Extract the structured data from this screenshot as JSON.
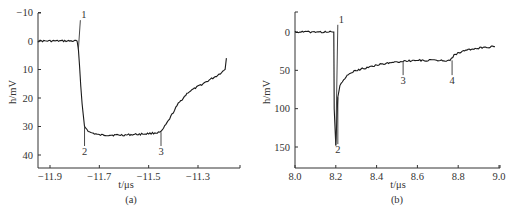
{
  "chart_data": [
    {
      "panel": "a",
      "type": "line",
      "caption": "(a)",
      "xlabel": "t/μs",
      "ylabel": "h/mV",
      "y_inverted": true,
      "xlim": [
        -11.95,
        -11.18
      ],
      "ylim": [
        -10,
        45
      ],
      "xticks": [
        -11.9,
        -11.7,
        -11.5,
        -11.3
      ],
      "yticks": [
        -10,
        0,
        10,
        20,
        30,
        40
      ],
      "xtick_labels": [
        "−11.9",
        "−11.7",
        "−11.5",
        "−11.3"
      ],
      "ytick_labels": [
        "−10",
        "0",
        "10",
        "20",
        "30",
        "40"
      ],
      "grid": false,
      "series": [
        {
          "name": "signal",
          "x": [
            -11.95,
            -11.9,
            -11.85,
            -11.79,
            -11.785,
            -11.77,
            -11.76,
            -11.74,
            -11.7,
            -11.6,
            -11.5,
            -11.45,
            -11.42,
            -11.38,
            -11.34,
            -11.3,
            -11.26,
            -11.22,
            -11.19,
            -11.185
          ],
          "y": [
            0,
            0,
            0,
            0,
            3,
            22,
            30,
            32,
            33,
            33,
            32.5,
            32,
            28,
            22,
            18,
            16,
            14,
            12,
            10,
            6
          ]
        }
      ],
      "annotations": [
        {
          "label": "1",
          "x": -11.785,
          "y": -8
        },
        {
          "label": "2",
          "x": -11.76,
          "y": 40
        },
        {
          "label": "3",
          "x": -11.45,
          "y": 40
        }
      ]
    },
    {
      "panel": "b",
      "type": "line",
      "caption": "(b)",
      "xlabel": "t/μs",
      "ylabel": "h/mV",
      "y_inverted": true,
      "xlim": [
        8.0,
        9.0
      ],
      "ylim": [
        -20,
        175
      ],
      "xticks": [
        8.0,
        8.2,
        8.4,
        8.6,
        8.8,
        9.0
      ],
      "yticks": [
        0,
        50,
        100,
        150
      ],
      "xtick_labels": [
        "8.0",
        "8.2",
        "8.4",
        "8.6",
        "8.8",
        "9.0"
      ],
      "ytick_labels": [
        "0",
        "50",
        "100",
        "150"
      ],
      "grid": false,
      "series": [
        {
          "name": "signal",
          "x": [
            8.0,
            8.1,
            8.19,
            8.192,
            8.2,
            8.205,
            8.21,
            8.22,
            8.25,
            8.3,
            8.4,
            8.5,
            8.53,
            8.6,
            8.7,
            8.76,
            8.78,
            8.82,
            8.9,
            8.98
          ],
          "y": [
            0,
            0,
            0,
            100,
            148,
            115,
            85,
            70,
            58,
            50,
            43,
            39,
            38,
            37,
            37,
            37,
            30,
            25,
            21,
            19
          ]
        }
      ],
      "annotations": [
        {
          "label": "1",
          "x": 8.2,
          "y": -12
        },
        {
          "label": "2",
          "x": 8.21,
          "y": 158
        },
        {
          "label": "3",
          "x": 8.53,
          "y": 68
        },
        {
          "label": "4",
          "x": 8.77,
          "y": 68
        }
      ]
    }
  ]
}
